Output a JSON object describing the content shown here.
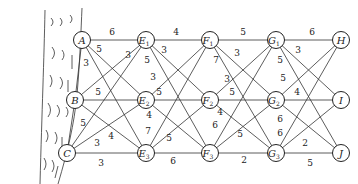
{
  "diagram": {
    "type": "layered-weighted-graph",
    "nodes": [
      {
        "id": "A",
        "label": "A",
        "sub": "",
        "x": 82,
        "y": 40
      },
      {
        "id": "B",
        "label": "B",
        "sub": "",
        "x": 75,
        "y": 100
      },
      {
        "id": "C",
        "label": "C",
        "sub": "",
        "x": 67,
        "y": 153
      },
      {
        "id": "E1",
        "label": "E",
        "sub": "1",
        "x": 146,
        "y": 40
      },
      {
        "id": "E2",
        "label": "E",
        "sub": "2",
        "x": 146,
        "y": 100
      },
      {
        "id": "E3",
        "label": "E",
        "sub": "3",
        "x": 146,
        "y": 153
      },
      {
        "id": "F1",
        "label": "F",
        "sub": "1",
        "x": 210,
        "y": 40
      },
      {
        "id": "F2",
        "label": "F",
        "sub": "2",
        "x": 210,
        "y": 100
      },
      {
        "id": "F3",
        "label": "F",
        "sub": "3",
        "x": 210,
        "y": 153
      },
      {
        "id": "G1",
        "label": "G",
        "sub": "1",
        "x": 276,
        "y": 40
      },
      {
        "id": "G2",
        "label": "G",
        "sub": "2",
        "x": 276,
        "y": 100
      },
      {
        "id": "G3",
        "label": "G",
        "sub": "3",
        "x": 276,
        "y": 153
      },
      {
        "id": "H",
        "label": "H",
        "sub": "",
        "x": 341,
        "y": 40
      },
      {
        "id": "I",
        "label": "I",
        "sub": "",
        "x": 341,
        "y": 100
      },
      {
        "id": "J",
        "label": "J",
        "sub": "",
        "x": 341,
        "y": 153
      }
    ],
    "edges": [
      {
        "from": "A",
        "to": "B",
        "weight": "3",
        "lx": 86,
        "ly": 66
      },
      {
        "from": "B",
        "to": "C",
        "weight": "5",
        "lx": 83,
        "ly": 126
      },
      {
        "from": "A",
        "to": "E1",
        "weight": "6",
        "lx": 112,
        "ly": 35
      },
      {
        "from": "A",
        "to": "E2",
        "weight": "5",
        "lx": 99,
        "ly": 52
      },
      {
        "from": "A",
        "to": "E3",
        "weight": "",
        "lx": 0,
        "ly": 0
      },
      {
        "from": "B",
        "to": "E1",
        "weight": "3",
        "lx": 128,
        "ly": 58
      },
      {
        "from": "B",
        "to": "E2",
        "weight": "5",
        "lx": 98,
        "ly": 95
      },
      {
        "from": "B",
        "to": "E3",
        "weight": "4",
        "lx": 111,
        "ly": 139
      },
      {
        "from": "C",
        "to": "E1",
        "weight": "",
        "lx": 0,
        "ly": 0
      },
      {
        "from": "C",
        "to": "E2",
        "weight": "3",
        "lx": 97,
        "ly": 146
      },
      {
        "from": "C",
        "to": "E3",
        "weight": "3",
        "lx": 101,
        "ly": 166
      },
      {
        "from": "E1",
        "to": "F1",
        "weight": "4",
        "lx": 176,
        "ly": 35
      },
      {
        "from": "E1",
        "to": "F2",
        "weight": "3",
        "lx": 164,
        "ly": 53
      },
      {
        "from": "E1",
        "to": "F3",
        "weight": "5",
        "lx": 147,
        "ly": 63
      },
      {
        "from": "E2",
        "to": "F1",
        "weight": "3",
        "lx": 153,
        "ly": 80
      },
      {
        "from": "E2",
        "to": "F2",
        "weight": "5",
        "lx": 159,
        "ly": 95
      },
      {
        "from": "E2",
        "to": "F3",
        "weight": "4",
        "lx": 149,
        "ly": 118
      },
      {
        "from": "E3",
        "to": "F1",
        "weight": "7",
        "lx": 148,
        "ly": 134
      },
      {
        "from": "E3",
        "to": "F2",
        "weight": "5",
        "lx": 169,
        "ly": 141
      },
      {
        "from": "E3",
        "to": "F3",
        "weight": "6",
        "lx": 173,
        "ly": 164
      },
      {
        "from": "F1",
        "to": "G1",
        "weight": "5",
        "lx": 243,
        "ly": 35
      },
      {
        "from": "F1",
        "to": "G2",
        "weight": "3",
        "lx": 237,
        "ly": 56
      },
      {
        "from": "F1",
        "to": "G3",
        "weight": "7",
        "lx": 216,
        "ly": 63
      },
      {
        "from": "F2",
        "to": "G1",
        "weight": "3",
        "lx": 227,
        "ly": 82
      },
      {
        "from": "F2",
        "to": "G2",
        "weight": "5",
        "lx": 232,
        "ly": 95
      },
      {
        "from": "F2",
        "to": "G3",
        "weight": "4",
        "lx": 220,
        "ly": 115
      },
      {
        "from": "F3",
        "to": "G1",
        "weight": "6",
        "lx": 215,
        "ly": 128
      },
      {
        "from": "F3",
        "to": "G2",
        "weight": "5",
        "lx": 240,
        "ly": 137
      },
      {
        "from": "F3",
        "to": "G3",
        "weight": "2",
        "lx": 244,
        "ly": 163
      },
      {
        "from": "G1",
        "to": "H",
        "weight": "6",
        "lx": 312,
        "ly": 35
      },
      {
        "from": "G1",
        "to": "I",
        "weight": "3",
        "lx": 298,
        "ly": 53
      },
      {
        "from": "G1",
        "to": "J",
        "weight": "5",
        "lx": 280,
        "ly": 63
      },
      {
        "from": "G2",
        "to": "H",
        "weight": "5",
        "lx": 283,
        "ly": 81
      },
      {
        "from": "G2",
        "to": "I",
        "weight": "4",
        "lx": 297,
        "ly": 95
      },
      {
        "from": "G2",
        "to": "J",
        "weight": "6",
        "lx": 280,
        "ly": 122
      },
      {
        "from": "G3",
        "to": "H",
        "weight": "6",
        "lx": 280,
        "ly": 136
      },
      {
        "from": "G3",
        "to": "I",
        "weight": "2",
        "lx": 305,
        "ly": 146
      },
      {
        "from": "G3",
        "to": "J",
        "weight": "5",
        "lx": 310,
        "ly": 166
      }
    ]
  }
}
